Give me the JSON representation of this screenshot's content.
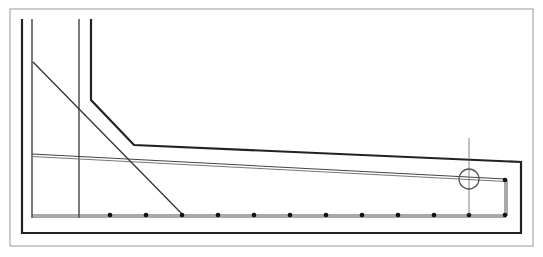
{
  "diagram": {
    "type": "reinforced-concrete-cantilever-slab-section",
    "colors": {
      "background": "#ffffff",
      "frame": "#9a9a9a",
      "concrete_outline": "#222222",
      "rebar": "#444444",
      "bar_dot": "#111111",
      "marker": "#555555"
    },
    "frame": {
      "x": 10,
      "y": 9,
      "w": 523,
      "h": 237
    },
    "concrete_outline": [
      [
        22,
        19
      ],
      [
        22,
        233
      ],
      [
        521,
        233
      ],
      [
        521,
        162
      ],
      [
        134,
        145
      ],
      [
        91,
        100
      ],
      [
        91,
        19
      ]
    ],
    "inner_wall_line_left": {
      "x": 32,
      "y1": 19,
      "y2": 218
    },
    "inner_wall_line_right": {
      "x": 79,
      "y1": 19,
      "y2": 218
    },
    "bottom_rebar": {
      "x1": 32,
      "x2": 506,
      "y": 216
    },
    "top_rebar": {
      "x1": 32,
      "y1": 155,
      "x2": 506,
      "y2": 180
    },
    "end_hook": {
      "x": 506,
      "y1": 180,
      "y2": 216
    },
    "diagonal_bar": {
      "x1": 33,
      "y1": 62,
      "x2": 183,
      "y2": 215
    },
    "bar_dots": [
      [
        110,
        215
      ],
      [
        146,
        215
      ],
      [
        182,
        215
      ],
      [
        218,
        215
      ],
      [
        254,
        215
      ],
      [
        290,
        215
      ],
      [
        326,
        215
      ],
      [
        362,
        215
      ],
      [
        398,
        215
      ],
      [
        434,
        215
      ],
      [
        469,
        215
      ],
      [
        505,
        215
      ],
      [
        505,
        180
      ]
    ],
    "section_marker": {
      "x": 469,
      "y1": 138,
      "y2": 215,
      "circle_cx": 469,
      "circle_cy": 179,
      "r": 10
    }
  }
}
